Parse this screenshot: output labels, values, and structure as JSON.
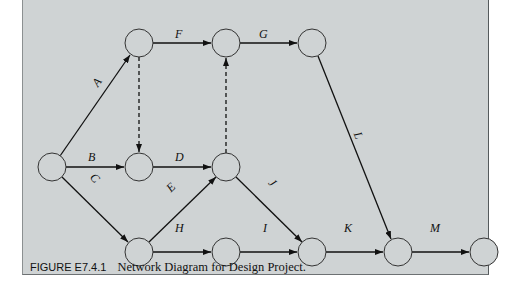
{
  "figure": {
    "number": "FIGURE E7.4.1",
    "caption": "Network Diagram for Design Project."
  },
  "diagram": {
    "type": "activity-on-arrow network",
    "nodes": [
      {
        "id": "n1",
        "x": 52,
        "y": 167
      },
      {
        "id": "n2",
        "x": 139,
        "y": 43
      },
      {
        "id": "n3",
        "x": 226,
        "y": 43
      },
      {
        "id": "n4",
        "x": 312,
        "y": 43
      },
      {
        "id": "n5",
        "x": 139,
        "y": 167
      },
      {
        "id": "n6",
        "x": 226,
        "y": 167
      },
      {
        "id": "n7",
        "x": 139,
        "y": 252
      },
      {
        "id": "n8",
        "x": 226,
        "y": 252
      },
      {
        "id": "n9",
        "x": 312,
        "y": 252
      },
      {
        "id": "n10",
        "x": 398,
        "y": 252
      },
      {
        "id": "n11",
        "x": 484,
        "y": 252
      }
    ],
    "edges": [
      {
        "label": "A",
        "from": "n1",
        "to": "n2",
        "dashed": false
      },
      {
        "label": "B",
        "from": "n1",
        "to": "n5",
        "dashed": false
      },
      {
        "label": "C",
        "from": "n1",
        "to": "n7",
        "dashed": false
      },
      {
        "label": "D",
        "from": "n5",
        "to": "n6",
        "dashed": false
      },
      {
        "label": "E",
        "from": "n7",
        "to": "n6",
        "dashed": false
      },
      {
        "label": "F",
        "from": "n2",
        "to": "n3",
        "dashed": false
      },
      {
        "label": "G",
        "from": "n3",
        "to": "n4",
        "dashed": false
      },
      {
        "label": "H",
        "from": "n7",
        "to": "n8",
        "dashed": false
      },
      {
        "label": "I",
        "from": "n8",
        "to": "n9",
        "dashed": false
      },
      {
        "label": "J",
        "from": "n6",
        "to": "n9",
        "dashed": false
      },
      {
        "label": "K",
        "from": "n9",
        "to": "n10",
        "dashed": false
      },
      {
        "label": "L",
        "from": "n4",
        "to": "n10",
        "dashed": false
      },
      {
        "label": "M",
        "from": "n10",
        "to": "n11",
        "dashed": false
      },
      {
        "label": "",
        "from": "n2",
        "to": "n5",
        "dashed": true
      },
      {
        "label": "",
        "from": "n6",
        "to": "n3",
        "dashed": true
      }
    ],
    "labels": {
      "A": "A",
      "B": "B",
      "C": "C",
      "D": "D",
      "E": "E",
      "F": "F",
      "G": "G",
      "H": "H",
      "I": "I",
      "J": "J",
      "K": "K",
      "L": "L",
      "M": "M"
    }
  }
}
